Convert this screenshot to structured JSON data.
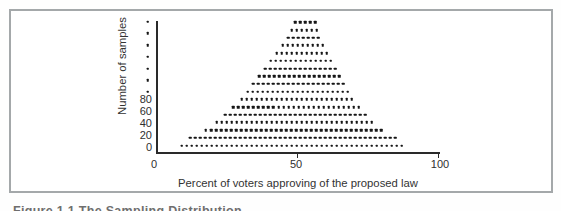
{
  "figure": {
    "caption_partial": "Figure 1.1  The Sampling Distribution"
  },
  "chart_data": {
    "type": "dot_plot",
    "title": "",
    "xlabel": "Percent of voters approving of the proposed law",
    "ylabel": "Number of samples",
    "x_tick_labels": [
      "0",
      "50",
      "100"
    ],
    "x_range": [
      0,
      100
    ],
    "y_tick_labels": [
      "0",
      "20",
      "40",
      "60",
      "80"
    ],
    "y_axis_continuation_dots": 7,
    "grid": false,
    "legend": false,
    "dot_color": "#161616",
    "dot_spacing_percent": 1.78,
    "row_height_samples": 12.7,
    "row_base_samples": 2.5,
    "rows_bottom_to_top": [
      45,
      42,
      36,
      32,
      29,
      26,
      23,
      21,
      19,
      17,
      15,
      13,
      11,
      9,
      7,
      6,
      5
    ],
    "row_center_percent_bottom": 48.0,
    "row_center_percent_top": 52.7,
    "total_dots": 356
  }
}
